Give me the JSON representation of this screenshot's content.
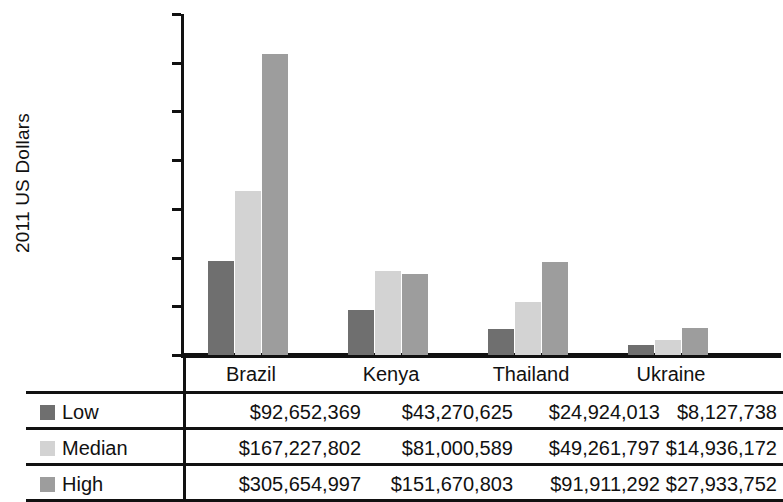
{
  "chart_data": {
    "type": "bar",
    "title": "",
    "xlabel": "",
    "ylabel": "2011 US Dollars",
    "categories": [
      "Brazil",
      "Kenya",
      "Thailand",
      "Ukraine"
    ],
    "series": [
      {
        "name": "Low",
        "color": "#6f6f6f",
        "values": [
          92652369,
          43270625,
          24924013,
          8127738
        ]
      },
      {
        "name": "Median",
        "color": "#d3d3d3",
        "values": [
          167227802,
          81000589,
          49261797,
          14936172
        ]
      },
      {
        "name": "High",
        "color": "#9d9d9d",
        "values": [
          305654997,
          151670803,
          91911292,
          27933752
        ]
      }
    ],
    "series_formatted": [
      {
        "name": "Low",
        "values": [
          "$92,652,369",
          "$43,270,625",
          "$24,924,013",
          "$8,127,738"
        ]
      },
      {
        "name": "Median",
        "values": [
          "$167,227,802",
          "$81,000,589",
          "$49,261,797",
          "$14,936,172"
        ]
      },
      {
        "name": "High",
        "values": [
          "$305,654,997",
          "$151,670,803",
          "$91,911,292",
          "$27,933,752"
        ]
      }
    ],
    "plotted_values": {
      "note": "Bar heights as drawn in the figure; Kenya High and Thailand High are drawn shorter than their table values.",
      "Low": [
        96000000,
        46000000,
        27000000,
        10000000
      ],
      "Median": [
        168000000,
        86000000,
        54000000,
        15000000
      ],
      "High": [
        309000000,
        83000000,
        95000000,
        28000000
      ]
    },
    "ylim": [
      0,
      350000000
    ],
    "ytick_values": [
      0,
      50000000,
      100000000,
      150000000,
      200000000,
      250000000,
      300000000,
      350000000
    ],
    "ytick_labels": [
      "0",
      "50,000,000",
      "100,000,000",
      "150,000,000",
      "200,000,000",
      "250,000,000",
      "300,000,000",
      "350,000,000"
    ],
    "grid": false,
    "legend_position": "table-left-column"
  },
  "table": {
    "row_labels": [
      "Low",
      "Median",
      "High"
    ],
    "column_headers": [
      "Brazil",
      "Kenya",
      "Thailand",
      "Ukraine"
    ],
    "rows": [
      {
        "label": "Low",
        "cells": [
          "$92,652,369",
          "$43,270,625",
          "$24,924,013",
          "$8,127,738"
        ]
      },
      {
        "label": "Median",
        "cells": [
          "$167,227,802",
          "$81,000,589",
          "$49,261,797",
          "$14,936,172"
        ]
      },
      {
        "label": "High",
        "cells": [
          "$305,654,997",
          "$151,670,803",
          "$91,911,292",
          "$27,933,752"
        ]
      }
    ]
  }
}
